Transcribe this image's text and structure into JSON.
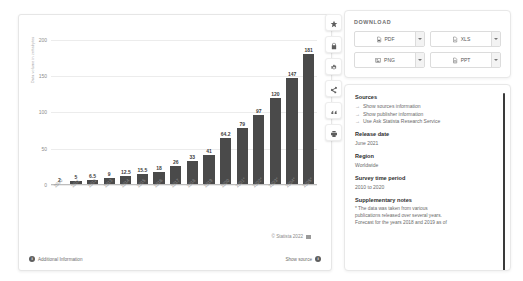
{
  "chart_data": {
    "type": "bar",
    "title": "",
    "xlabel": "",
    "ylabel": "Data volume in zettabytes",
    "ylim": [
      0,
      215
    ],
    "yticks": [
      0,
      50,
      100,
      150,
      200
    ],
    "grid": true,
    "legend": null,
    "categories": [
      "2010",
      "2011",
      "2012",
      "2013",
      "2014",
      "2015",
      "2016",
      "2017",
      "2018",
      "2019",
      "2020",
      "2021*",
      "2022*",
      "2023*",
      "2024*",
      "2025*"
    ],
    "values": [
      2,
      5,
      6.5,
      9,
      12.5,
      15.5,
      18,
      26,
      33,
      41,
      64.2,
      79,
      97,
      120,
      147,
      181
    ],
    "value_labels": [
      "2",
      "5",
      "6.5",
      "9",
      "12.5",
      "15.5",
      "18",
      "26",
      "33",
      "41",
      "64.2",
      "79",
      "97",
      "120",
      "147",
      "181"
    ],
    "bar_color": "#4a4a4a"
  },
  "chart_footer": {
    "copyright": "© Statista 2022",
    "additional_information": "Additional Information",
    "show_source": "Show source",
    "info_glyph": "i"
  },
  "rail": {
    "items": [
      {
        "name": "favorite-icon",
        "tooltip": "Add to favorites"
      },
      {
        "name": "lock-icon",
        "tooltip": "Premium content"
      },
      {
        "name": "settings-icon",
        "tooltip": "Settings"
      },
      {
        "name": "share-icon",
        "tooltip": "Share"
      },
      {
        "name": "citation-icon",
        "tooltip": "Cite"
      },
      {
        "name": "print-icon",
        "tooltip": "Print"
      }
    ]
  },
  "download": {
    "title": "DOWNLOAD",
    "buttons": [
      {
        "label": "PDF",
        "icon": "pdf-file-icon"
      },
      {
        "label": "XLS",
        "icon": "xls-file-icon"
      },
      {
        "label": "PNG",
        "icon": "png-image-icon"
      },
      {
        "label": "PPT",
        "icon": "ppt-file-icon"
      }
    ],
    "caret": "▾"
  },
  "info": {
    "sources_heading": "Sources",
    "links": [
      "Show sources information",
      "Show publisher information",
      "Use Ask Statista Research Service"
    ],
    "arrow": "→",
    "release_date_heading": "Release date",
    "release_date_value": "June 2021",
    "region_heading": "Region",
    "region_value": "Worldwide",
    "survey_heading": "Survey time period",
    "survey_value": "2010 to 2020",
    "notes_heading": "Supplementary notes",
    "notes_lines": [
      "* The data was taken from various",
      "publications released over several years.",
      "Forecast for the years 2018 and 2019 as of"
    ]
  }
}
